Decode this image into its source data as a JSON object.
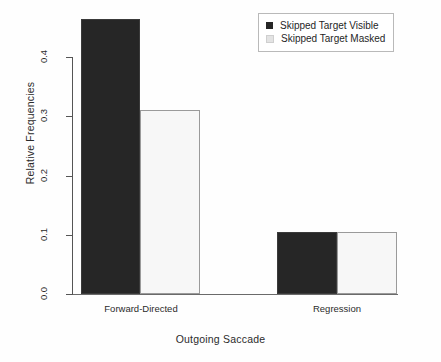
{
  "chart_data": {
    "type": "bar",
    "title": "",
    "xlabel": "Outgoing Saccade",
    "ylabel": "Relative Frequencies",
    "categories": [
      "Forward-Directed",
      "Regression"
    ],
    "series": [
      {
        "name": "Skipped Target Visible",
        "values": [
          0.465,
          0.105
        ],
        "color": "#262626"
      },
      {
        "name": "Skipped Target Masked",
        "values": [
          0.31,
          0.105
        ],
        "color": "#f7f7f7"
      }
    ],
    "ylim": [
      0.0,
      0.4
    ],
    "yticks": [
      "0.0",
      "0.1",
      "0.2",
      "0.3",
      "0.4"
    ],
    "ytick_values": [
      0.0,
      0.1,
      0.2,
      0.3,
      0.4
    ],
    "grid": false,
    "legend_position": "top-right"
  },
  "axes": {
    "y_title": "Relative Frequencies",
    "x_title": "Outgoing Saccade"
  },
  "legend": {
    "entries": [
      {
        "label": "Skipped Target Visible",
        "swatch": "dark"
      },
      {
        "label": "Skipped Target Masked",
        "swatch": "light"
      }
    ]
  }
}
